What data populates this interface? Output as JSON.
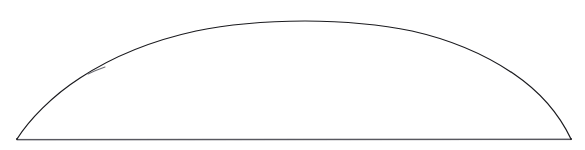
{
  "figure": {
    "background_color": "#ffffff",
    "canvas": {
      "width": 585,
      "height": 150
    },
    "shape": {
      "name": "circular-segment",
      "arc_color": "#1b1b1f",
      "chord_color": "#58585f",
      "stroke_width": 1.25,
      "style": "hand-drawn",
      "closed": true,
      "fill": "none"
    },
    "geometry": {
      "left_vertex": {
        "x": 17,
        "y": 139
      },
      "right_vertex": {
        "x": 571,
        "y": 139
      },
      "apex": {
        "x": 305,
        "y": 21
      },
      "chord_length": 554,
      "segment_height": 118,
      "apex_flat_span": {
        "x_start": 280,
        "x_end": 360
      }
    },
    "arc_path": "M 17 139 C 29 120, 52 96, 80 78 C 112 57, 150 41, 196 31 C 232 23.5, 268 21.2, 305 21 C 342 21.2, 378 24, 412 31 C 452 40, 486 55, 514 74 C 542 93, 560 116, 571 139",
    "arc_highlight_path": "M 88 74 C 93 71.5, 99 69.2, 105 67",
    "chord_path": "M 17 139.6 L 571 139.3",
    "pen_skip": {
      "x": 98,
      "y": 72,
      "present": true
    },
    "sampled_points": [
      {
        "x": 17,
        "y": 139
      },
      {
        "x": 20,
        "y": 135
      },
      {
        "x": 50,
        "y": 105
      },
      {
        "x": 80,
        "y": 78
      },
      {
        "x": 98,
        "y": 72
      },
      {
        "x": 140,
        "y": 53
      },
      {
        "x": 200,
        "y": 31
      },
      {
        "x": 260,
        "y": 23
      },
      {
        "x": 305,
        "y": 21
      },
      {
        "x": 360,
        "y": 22
      },
      {
        "x": 380,
        "y": 28
      },
      {
        "x": 440,
        "y": 45
      },
      {
        "x": 500,
        "y": 75
      },
      {
        "x": 520,
        "y": 93
      },
      {
        "x": 570,
        "y": 138
      },
      {
        "x": 571,
        "y": 139
      }
    ]
  }
}
